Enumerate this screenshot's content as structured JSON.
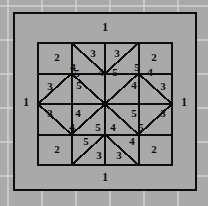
{
  "diagram": {
    "background_color": "#a9a9a9",
    "patch_color": "#a9a9a9",
    "line_color": "#0d0d0d",
    "grid_line_color": "#d8d8d8",
    "frame": {
      "x": 14,
      "y": 13,
      "width": 182,
      "height": 177
    },
    "inner": {
      "x": 38,
      "y": 43,
      "width": 134,
      "height": 122
    },
    "border_labels": [
      {
        "id": "border-top",
        "value": "1",
        "x": 105,
        "y": 28
      },
      {
        "id": "border-bottom",
        "value": "1",
        "x": 105,
        "y": 178
      },
      {
        "id": "border-left",
        "value": "1",
        "x": 26,
        "y": 103
      },
      {
        "id": "border-right",
        "value": "1",
        "x": 184,
        "y": 103
      }
    ],
    "patch_labels": [
      {
        "id": "patch-r1c1",
        "value": "2",
        "x": 57,
        "y": 58
      },
      {
        "id": "patch-r1c2-lower",
        "value": "4",
        "x": 73,
        "y": 68
      },
      {
        "id": "patch-r1c2-upper",
        "value": "3",
        "x": 93,
        "y": 54
      },
      {
        "id": "patch-r1c3-upper",
        "value": "3",
        "x": 117,
        "y": 54
      },
      {
        "id": "patch-r1c3-lower",
        "value": "5",
        "x": 137,
        "y": 68
      },
      {
        "id": "patch-r1c4",
        "value": "2",
        "x": 154,
        "y": 58
      },
      {
        "id": "patch-r2c1-upper",
        "value": "5",
        "x": 77,
        "y": 74
      },
      {
        "id": "patch-r2c1-lower",
        "value": "3",
        "x": 50,
        "y": 87
      },
      {
        "id": "patch-r2c2-upper",
        "value": "4",
        "x": 101,
        "y": 73
      },
      {
        "id": "patch-r2c2-lower",
        "value": "5",
        "x": 79,
        "y": 86
      },
      {
        "id": "patch-r2c3-upper",
        "value": "5",
        "x": 115,
        "y": 73
      },
      {
        "id": "patch-r2c3-lower",
        "value": "4",
        "x": 134,
        "y": 86
      },
      {
        "id": "patch-r2c4-upper",
        "value": "4",
        "x": 150,
        "y": 73
      },
      {
        "id": "patch-r2c4-lower",
        "value": "3",
        "x": 163,
        "y": 87
      },
      {
        "id": "patch-r3c1-upper",
        "value": "3",
        "x": 50,
        "y": 114
      },
      {
        "id": "patch-r3c1-lower",
        "value": "4",
        "x": 72,
        "y": 128
      },
      {
        "id": "patch-r3c2-upper",
        "value": "4",
        "x": 78,
        "y": 114
      },
      {
        "id": "patch-r3c2-lower",
        "value": "5",
        "x": 98,
        "y": 128
      },
      {
        "id": "patch-r3c3-upper",
        "value": "5",
        "x": 134,
        "y": 114
      },
      {
        "id": "patch-r3c3-lower",
        "value": "4",
        "x": 113,
        "y": 128
      },
      {
        "id": "patch-r3c4-upper",
        "value": "3",
        "x": 163,
        "y": 114
      },
      {
        "id": "patch-r3c4-lower",
        "value": "5",
        "x": 141,
        "y": 128
      },
      {
        "id": "patch-r4c1",
        "value": "2",
        "x": 57,
        "y": 150
      },
      {
        "id": "patch-r4c2-upper",
        "value": "5",
        "x": 86,
        "y": 142
      },
      {
        "id": "patch-r4c2-lower",
        "value": "3",
        "x": 99,
        "y": 156
      },
      {
        "id": "patch-r4c3-lower",
        "value": "3",
        "x": 119,
        "y": 156
      },
      {
        "id": "patch-r4c3-upper",
        "value": "4",
        "x": 132,
        "y": 142
      },
      {
        "id": "patch-r4c4",
        "value": "2",
        "x": 154,
        "y": 150
      }
    ]
  }
}
